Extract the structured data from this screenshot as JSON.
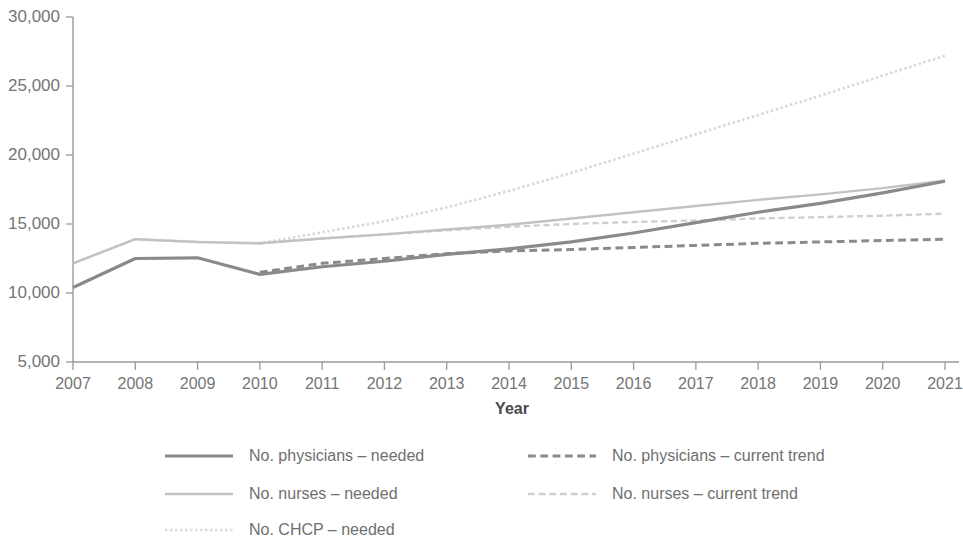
{
  "chart_data": {
    "type": "line",
    "title": "",
    "subtitle": "",
    "xlabel": "Year",
    "ylabel": "",
    "grid": false,
    "legend_position": "bottom",
    "x": [
      2007,
      2008,
      2009,
      2010,
      2011,
      2012,
      2013,
      2014,
      2015,
      2016,
      2017,
      2018,
      2019,
      2020,
      2021
    ],
    "categories": [
      "2007",
      "2008",
      "2009",
      "2010",
      "2011",
      "2012",
      "2013",
      "2014",
      "2015",
      "2016",
      "2017",
      "2018",
      "2019",
      "2020",
      "2021"
    ],
    "xlim": [
      2007,
      2021
    ],
    "ylim": [
      5000,
      30000
    ],
    "ytick_values": [
      5000,
      10000,
      15000,
      20000,
      25000,
      30000
    ],
    "ytick_labels": [
      "5,000",
      "10,000",
      "15,000",
      "20,000",
      "25,000",
      "30,000"
    ],
    "series": [
      {
        "name": "No. physicians – needed",
        "style": "solid",
        "color": "#8a8a8a",
        "width": 3.2,
        "x": [
          2007,
          2008,
          2009,
          2010,
          2011,
          2012,
          2013,
          2014,
          2015,
          2016,
          2017,
          2018,
          2019,
          2020,
          2021
        ],
        "values": [
          10400,
          12500,
          12550,
          11350,
          11900,
          12300,
          12800,
          13200,
          13700,
          14350,
          15100,
          15850,
          16500,
          17250,
          18100
        ]
      },
      {
        "name": "No. nurses – needed",
        "style": "solid",
        "color": "#c2c2c2",
        "width": 2.4,
        "x": [
          2007,
          2008,
          2009,
          2010,
          2011,
          2012,
          2013,
          2014,
          2015,
          2016,
          2017,
          2018,
          2019,
          2020,
          2021
        ],
        "values": [
          12150,
          13900,
          13700,
          13600,
          13950,
          14250,
          14600,
          14950,
          15400,
          15850,
          16300,
          16750,
          17150,
          17600,
          18150
        ]
      },
      {
        "name": "No. CHCP – needed",
        "style": "dotted",
        "color": "#d8d8d8",
        "width": 2.6,
        "x": [
          2007,
          2008,
          2009,
          2010,
          2011,
          2012,
          2013,
          2014,
          2015,
          2016,
          2017,
          2018,
          2019,
          2020,
          2021
        ],
        "values": [
          12150,
          13900,
          13700,
          13600,
          14400,
          15200,
          16200,
          17400,
          18700,
          20100,
          21500,
          22900,
          24300,
          25750,
          27200
        ]
      },
      {
        "name": "No. physicians – current trend",
        "style": "dashed",
        "color": "#8a8a8a",
        "width": 3.0,
        "x": [
          2010,
          2011,
          2012,
          2013,
          2014,
          2015,
          2016,
          2017,
          2018,
          2019,
          2020,
          2021
        ],
        "values": [
          11500,
          12150,
          12500,
          12850,
          13050,
          13150,
          13300,
          13450,
          13600,
          13700,
          13800,
          13900
        ]
      },
      {
        "name": "No. nurses – current trend",
        "style": "dashed",
        "color": "#cfcfcf",
        "width": 2.4,
        "x": [
          2010,
          2011,
          2012,
          2013,
          2014,
          2015,
          2016,
          2017,
          2018,
          2019,
          2020,
          2021
        ],
        "values": [
          13600,
          13950,
          14250,
          14550,
          14800,
          15000,
          15150,
          15250,
          15400,
          15500,
          15600,
          15750
        ]
      }
    ]
  },
  "axes": {
    "y_labels": [
      "30,000",
      "25,000",
      "20,000",
      "15,000",
      "10,000",
      "5,000"
    ],
    "x_labels": [
      "2007",
      "2008",
      "2009",
      "2010",
      "2011",
      "2012",
      "2013",
      "2014",
      "2015",
      "2016",
      "2017",
      "2018",
      "2019",
      "2020",
      "2021"
    ],
    "x_title": "Year"
  },
  "legend": {
    "items": [
      {
        "label": "No. physicians – needed",
        "style": "solid",
        "color": "#8a8a8a",
        "width": 3.2,
        "col": 0,
        "row": 0
      },
      {
        "label": "No. nurses – needed",
        "style": "solid",
        "color": "#c2c2c2",
        "width": 2.6,
        "col": 0,
        "row": 1
      },
      {
        "label": "No. CHCP – needed",
        "style": "dotted",
        "color": "#dcdcdc",
        "width": 2.6,
        "col": 0,
        "row": 2
      },
      {
        "label": "No. physicians – current trend",
        "style": "dashed",
        "color": "#8a8a8a",
        "width": 3.0,
        "col": 1,
        "row": 0
      },
      {
        "label": "No. nurses – current trend",
        "style": "dashed",
        "color": "#cfcfcf",
        "width": 2.6,
        "col": 1,
        "row": 1
      }
    ]
  },
  "colors": {
    "axis": "#9a9a9a",
    "tick_text": "#757575",
    "axis_title": "#4a4a4a",
    "legend_text": "#6f6f6f",
    "background": "#ffffff"
  }
}
